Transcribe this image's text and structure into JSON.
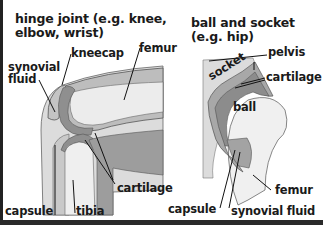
{
  "diagram": {
    "hinge": {
      "title_line1": "hinge joint (e.g. knee,",
      "title_line2": "elbow, wrist)",
      "labels": {
        "kneecap": "kneecap",
        "femur": "femur",
        "synovial_fluid_line1": "synovial",
        "synovial_fluid_line2": "fluid",
        "cartilage": "cartilage",
        "capsule": "capsule",
        "tibia": "tibia"
      }
    },
    "ball_socket": {
      "title_line1": "ball and socket",
      "title_line2": "(e.g. hip)",
      "labels": {
        "pelvis": "pelvis",
        "socket": "socket",
        "cartilage": "cartilage",
        "ball": "ball",
        "femur": "femur",
        "capsule": "capsule",
        "synovial_fluid": "synovial fluid"
      }
    },
    "colors": {
      "background": "#ffffff",
      "bone_light": "#e6e6e6",
      "bone_mid": "#c8c8c8",
      "cartilage": "#9a9a9a",
      "capsule": "#b4b4b4",
      "outline": "#555555",
      "text": "#1a1a1a"
    }
  }
}
